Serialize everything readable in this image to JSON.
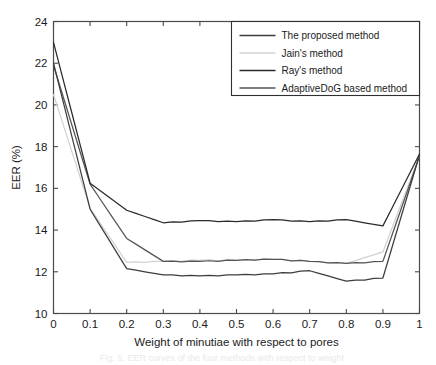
{
  "figure": {
    "background_color": "#ffffff",
    "axis_color": "#4a4a4a",
    "text_color": "#1b1b1b"
  },
  "axes": {
    "y_title": "EER (%)",
    "x_title": "Weight of minutiae with respect to pores",
    "y_ticks": [
      "10",
      "12",
      "14",
      "16",
      "18",
      "20",
      "22",
      "24"
    ],
    "x_ticks": [
      "0",
      "0.1",
      "0.2",
      "0.3",
      "0.4",
      "0.5",
      "0.6",
      "0.7",
      "0.8",
      "0.9",
      "1"
    ]
  },
  "legend": {
    "items": [
      {
        "label": "The proposed method",
        "color": "#3d3d3d"
      },
      {
        "label": "Jain's method",
        "color": "#d2d2d2"
      },
      {
        "label": "Ray's method",
        "color": "#2a2a2a"
      },
      {
        "label": "AdaptiveDoG based method",
        "color": "#555555"
      }
    ]
  },
  "caption_ghost": "Fig. 5.  EER curves of the four methods with respect to weight",
  "chart_data": {
    "type": "line",
    "title": "",
    "xlabel": "Weight of minutiae with respect to pores",
    "ylabel": "EER (%)",
    "xlim": [
      0,
      1
    ],
    "ylim": [
      10,
      24
    ],
    "xtick_step": 0.1,
    "ytick_step": 2,
    "grid": false,
    "legend_position": "top-right",
    "x": [
      0,
      0.1,
      0.2,
      0.3,
      0.4,
      0.5,
      0.6,
      0.7,
      0.8,
      0.9,
      1.0
    ],
    "series": [
      {
        "name": "The proposed method",
        "color": "#3d3d3d",
        "values": [
          22.0,
          15.0,
          12.15,
          11.85,
          11.8,
          11.85,
          11.9,
          12.05,
          11.55,
          11.7,
          17.6
        ]
      },
      {
        "name": "Jain's method",
        "color": "#d2d2d2",
        "values": [
          20.5,
          15.05,
          12.45,
          12.5,
          12.55,
          12.55,
          12.6,
          12.5,
          12.4,
          12.95,
          17.55
        ]
      },
      {
        "name": "Ray's method",
        "color": "#2a2a2a",
        "values": [
          23.0,
          16.25,
          14.95,
          14.35,
          14.45,
          14.4,
          14.5,
          14.4,
          14.5,
          14.2,
          17.65
        ]
      },
      {
        "name": "AdaptiveDoG based method",
        "color": "#555555",
        "values": [
          21.9,
          16.2,
          13.6,
          12.5,
          12.5,
          12.55,
          12.6,
          12.5,
          12.4,
          12.5,
          17.55
        ]
      }
    ]
  }
}
